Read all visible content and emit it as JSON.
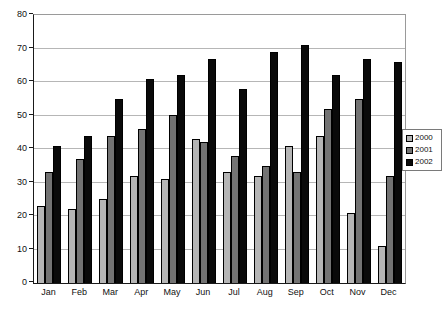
{
  "chart_data": {
    "type": "bar",
    "title": "",
    "xlabel": "",
    "ylabel": "",
    "categories": [
      "Jan",
      "Feb",
      "Mar",
      "Apr",
      "May",
      "Jun",
      "Jul",
      "Aug",
      "Sep",
      "Oct",
      "Nov",
      "Dec"
    ],
    "series": [
      {
        "name": "2000",
        "color": "#b5b5b5",
        "values": [
          23,
          22,
          25,
          32,
          31,
          43,
          33,
          32,
          41,
          44,
          21,
          11
        ]
      },
      {
        "name": "2001",
        "color": "#737373",
        "values": [
          33,
          37,
          44,
          46,
          50,
          42,
          38,
          35,
          33,
          52,
          55,
          32
        ]
      },
      {
        "name": "2002",
        "color": "#0a0a0a",
        "values": [
          41,
          44,
          55,
          61,
          62,
          67,
          58,
          69,
          71,
          62,
          67,
          66
        ]
      }
    ],
    "ylim": [
      0,
      80
    ],
    "y_ticks": [
      0,
      10,
      20,
      30,
      40,
      50,
      60,
      70,
      80
    ],
    "grid": true,
    "legend_position": "right",
    "colors": {
      "background": "#ffffff",
      "gridline": "#b6b6b6",
      "axis": "#1a1a1a",
      "plot_border": "#9a9a9a",
      "legend_border": "#7a7a7a",
      "bar_border": "#000000"
    }
  }
}
